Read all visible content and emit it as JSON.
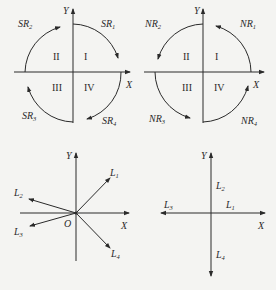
{
  "panels": {
    "top_left": {
      "axis_x": "X",
      "axis_y": "Y",
      "quadrants": [
        "I",
        "II",
        "III",
        "IV"
      ],
      "arcs": [
        {
          "label": "SR",
          "sub": "1",
          "direction": "clockwise"
        },
        {
          "label": "SR",
          "sub": "2",
          "direction": "clockwise"
        },
        {
          "label": "SR",
          "sub": "3",
          "direction": "clockwise"
        },
        {
          "label": "SR",
          "sub": "4",
          "direction": "clockwise"
        }
      ]
    },
    "top_right": {
      "axis_x": "X",
      "axis_y": "Y",
      "quadrants": [
        "I",
        "II",
        "III",
        "IV"
      ],
      "arcs": [
        {
          "label": "NR",
          "sub": "1",
          "direction": "counterclockwise"
        },
        {
          "label": "NR",
          "sub": "2",
          "direction": "counterclockwise"
        },
        {
          "label": "NR",
          "sub": "3",
          "direction": "counterclockwise"
        },
        {
          "label": "NR",
          "sub": "4",
          "direction": "counterclockwise"
        }
      ]
    },
    "bottom_left": {
      "axis_x": "X",
      "axis_y": "Y",
      "origin": "O",
      "vectors": [
        {
          "label": "L",
          "sub": "1"
        },
        {
          "label": "L",
          "sub": "2"
        },
        {
          "label": "L",
          "sub": "3"
        },
        {
          "label": "L",
          "sub": "4"
        }
      ]
    },
    "bottom_right": {
      "axis_x": "X",
      "axis_y": "Y",
      "vectors": [
        {
          "label": "L",
          "sub": "1"
        },
        {
          "label": "L",
          "sub": "2"
        },
        {
          "label": "L",
          "sub": "3"
        },
        {
          "label": "L",
          "sub": "4"
        }
      ]
    }
  }
}
